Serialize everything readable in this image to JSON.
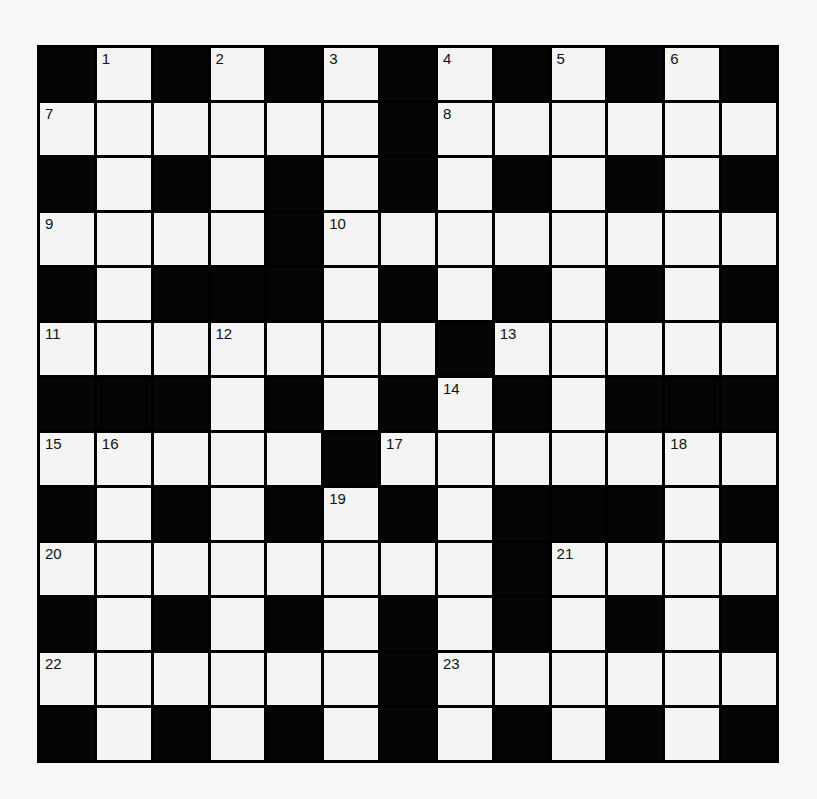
{
  "puzzle": {
    "rows": 13,
    "cols": 13,
    "colors": {
      "block": "#050505",
      "open": "#f4f4f4",
      "page": "#f7f7f7",
      "line": "#000000"
    },
    "grid": [
      "#.#.#.#.#.#.#",
      "......#......",
      "#.#.#.#.#.#.#",
      "....#........",
      "#.###.#.#.#.#",
      ".......#.....",
      "###.#.#.#.###",
      ".....#.......",
      "#.#.#.#.###.#",
      "........#....",
      "#.#.#.#.#.#.#",
      "......#......",
      "#.#.#.#.#.#.#"
    ],
    "numbers": [
      {
        "row": 0,
        "col": 1,
        "n": "1"
      },
      {
        "row": 0,
        "col": 3,
        "n": "2"
      },
      {
        "row": 0,
        "col": 5,
        "n": "3"
      },
      {
        "row": 0,
        "col": 7,
        "n": "4"
      },
      {
        "row": 0,
        "col": 9,
        "n": "5"
      },
      {
        "row": 0,
        "col": 11,
        "n": "6"
      },
      {
        "row": 1,
        "col": 0,
        "n": "7"
      },
      {
        "row": 1,
        "col": 7,
        "n": "8"
      },
      {
        "row": 3,
        "col": 0,
        "n": "9"
      },
      {
        "row": 3,
        "col": 5,
        "n": "10"
      },
      {
        "row": 5,
        "col": 0,
        "n": "11"
      },
      {
        "row": 5,
        "col": 3,
        "n": "12"
      },
      {
        "row": 5,
        "col": 8,
        "n": "13"
      },
      {
        "row": 6,
        "col": 7,
        "n": "14"
      },
      {
        "row": 7,
        "col": 0,
        "n": "15"
      },
      {
        "row": 7,
        "col": 1,
        "n": "16"
      },
      {
        "row": 7,
        "col": 6,
        "n": "17"
      },
      {
        "row": 7,
        "col": 11,
        "n": "18"
      },
      {
        "row": 8,
        "col": 5,
        "n": "19"
      },
      {
        "row": 9,
        "col": 0,
        "n": "20"
      },
      {
        "row": 9,
        "col": 9,
        "n": "21"
      },
      {
        "row": 11,
        "col": 0,
        "n": "22"
      },
      {
        "row": 11,
        "col": 7,
        "n": "23"
      }
    ],
    "entries": {}
  }
}
